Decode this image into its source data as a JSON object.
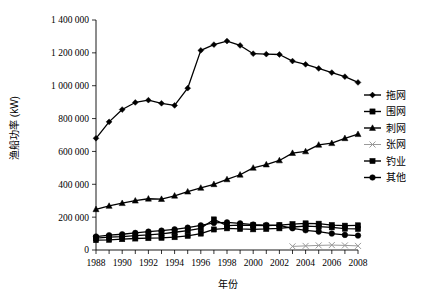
{
  "chart_data": {
    "type": "line",
    "title": "",
    "xlabel": "年份",
    "ylabel": "渔船功率 (kW)",
    "xlim": [
      1988,
      2008
    ],
    "ylim": [
      0,
      1400000
    ],
    "ytick_step": 200000,
    "grid": false,
    "legend_position": "right",
    "x": [
      1988,
      1989,
      1990,
      1991,
      1992,
      1993,
      1994,
      1995,
      1996,
      1997,
      1998,
      1999,
      2000,
      2001,
      2002,
      2003,
      2004,
      2005,
      2006,
      2007,
      2008
    ],
    "ytick_labels": [
      "0",
      "200 000",
      "400 000",
      "600 000",
      "800 000",
      "1 000 000",
      "1 200 000",
      "1 400 000"
    ],
    "ytick_values": [
      0,
      200000,
      400000,
      600000,
      800000,
      1000000,
      1200000,
      1400000
    ],
    "xtick_labels": [
      "1988",
      "1990",
      "1992",
      "1994",
      "1996",
      "1998",
      "2000",
      "2002",
      "2004",
      "2006",
      "2008"
    ],
    "xtick_values": [
      1988,
      1990,
      1992,
      1994,
      1996,
      1998,
      2000,
      2002,
      2004,
      2006,
      2008
    ],
    "series": [
      {
        "name": "拖网",
        "marker": "diamond",
        "color": "#000000",
        "values": [
          680000,
          780000,
          855000,
          898000,
          912000,
          893000,
          880000,
          985000,
          1215000,
          1250000,
          1272000,
          1245000,
          1195000,
          1192000,
          1190000,
          1150000,
          1130000,
          1105000,
          1080000,
          1055000,
          1020000
        ]
      },
      {
        "name": "围网",
        "marker": "square",
        "color": "#000000",
        "values": [
          72000,
          78000,
          82000,
          88000,
          92000,
          98000,
          108000,
          118000,
          132000,
          186000,
          148000,
          152000,
          150000,
          148000,
          152000,
          158000,
          162000,
          160000,
          152000,
          148000,
          150000
        ]
      },
      {
        "name": "刺网",
        "marker": "triangle",
        "color": "#000000",
        "values": [
          248000,
          268000,
          285000,
          300000,
          312000,
          310000,
          330000,
          355000,
          378000,
          400000,
          430000,
          458000,
          500000,
          520000,
          545000,
          590000,
          600000,
          640000,
          650000,
          680000,
          705000
        ]
      },
      {
        "name": "张网",
        "marker": "cross",
        "color": "#9a9a9a",
        "values": [
          null,
          null,
          null,
          null,
          null,
          null,
          null,
          null,
          null,
          null,
          null,
          null,
          null,
          null,
          null,
          22000,
          25000,
          28000,
          30000,
          28000,
          25000
        ]
      },
      {
        "name": "钓业",
        "marker": "square",
        "color": "#000000",
        "values": [
          60000,
          62000,
          66000,
          70000,
          72000,
          74000,
          78000,
          86000,
          100000,
          125000,
          132000,
          128000,
          126000,
          128000,
          132000,
          140000,
          145000,
          142000,
          138000,
          130000,
          128000
        ]
      },
      {
        "name": "其他",
        "marker": "circle",
        "color": "#000000",
        "values": [
          82000,
          90000,
          96000,
          104000,
          112000,
          118000,
          126000,
          136000,
          150000,
          165000,
          168000,
          162000,
          155000,
          152000,
          150000,
          132000,
          120000,
          112000,
          100000,
          92000,
          88000
        ]
      }
    ]
  },
  "legend": {
    "items": [
      {
        "label": "拖网"
      },
      {
        "label": "围网"
      },
      {
        "label": "刺网"
      },
      {
        "label": "张网"
      },
      {
        "label": "钓业"
      },
      {
        "label": "其他"
      }
    ]
  }
}
